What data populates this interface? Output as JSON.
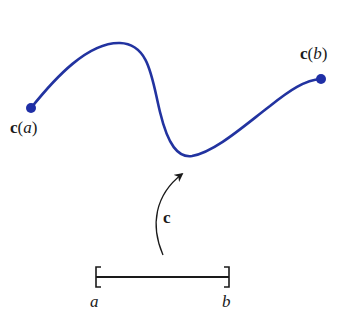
{
  "diagram": {
    "colors": {
      "curve": "#2233a0",
      "ink": "#1a1a1a",
      "background": "#ffffff"
    },
    "curve": {
      "start_label_func": "c",
      "start_label_arg": "a",
      "end_label_func": "c",
      "end_label_arg": "b"
    },
    "map_arrow": {
      "label": "c"
    },
    "interval": {
      "left_label": "a",
      "right_label": "b"
    }
  }
}
